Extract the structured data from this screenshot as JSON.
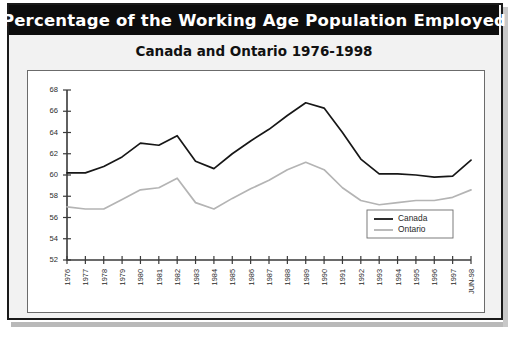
{
  "banner": {
    "title": "Percentage of the Working Age Population Employed"
  },
  "subtitle": {
    "text": "Canada and Ontario 1976-1998"
  },
  "legend": {
    "items": [
      {
        "label": "Canada",
        "color": "#171717"
      },
      {
        "label": "Ontario",
        "color": "#b4b4b4"
      }
    ]
  },
  "colors": {
    "banner_background": "#0d0d0d",
    "banner_text": "#ffffff",
    "panel_background": "#f2f2f2",
    "plot_background": "#ffffff",
    "frame_border": "#1a1a1a",
    "canada_line": "#171717",
    "ontario_line": "#b4b4b4",
    "axis": "#3a3a3a"
  },
  "chart_data": {
    "type": "line",
    "title": "Percentage of the Working Age Population Employed",
    "subtitle": "Canada and Ontario 1976-1998",
    "xlabel": "",
    "ylabel": "",
    "grid": false,
    "legend_position": "bottom-right",
    "ylim": [
      52,
      68
    ],
    "yticks": [
      52,
      54,
      56,
      58,
      60,
      62,
      64,
      66,
      68
    ],
    "categories": [
      "1976",
      "1977",
      "1978",
      "1979",
      "1980",
      "1981",
      "1982",
      "1983",
      "1984",
      "1985",
      "1986",
      "1987",
      "1988",
      "1989",
      "1990",
      "1991",
      "1992",
      "1993",
      "1994",
      "1995",
      "1996",
      "1997",
      "JUN-98"
    ],
    "series": [
      {
        "name": "Canada",
        "color": "#171717",
        "values": [
          60.2,
          60.2,
          60.8,
          61.7,
          63.0,
          62.8,
          63.7,
          61.3,
          60.6,
          62.0,
          63.2,
          64.3,
          65.6,
          66.8,
          66.3,
          64.0,
          61.5,
          60.1,
          60.1,
          60.0,
          59.8,
          59.9,
          61.4
        ]
      },
      {
        "name": "Ontario",
        "color": "#b4b4b4",
        "values": [
          57.0,
          56.8,
          56.8,
          57.7,
          58.6,
          58.8,
          59.7,
          57.4,
          56.8,
          57.8,
          58.7,
          59.5,
          60.5,
          61.2,
          60.5,
          58.8,
          57.6,
          57.2,
          57.4,
          57.6,
          57.6,
          57.9,
          58.6
        ]
      }
    ]
  }
}
